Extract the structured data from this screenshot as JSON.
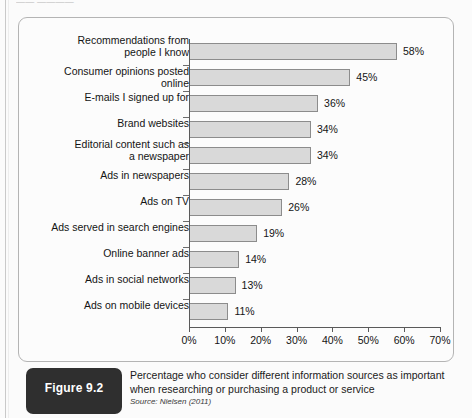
{
  "page": {
    "top_clipped_text": "—— ————"
  },
  "caption": {
    "figure_label": "Figure 9.2",
    "title": "Percentage who consider different information sources as important when researching or purchasing a product or service",
    "source": "Source: Nielsen (2011)"
  },
  "chart_data": {
    "type": "bar",
    "orientation": "horizontal",
    "title": "Percentage who consider different information sources as important when researching or purchasing a product or service",
    "xlabel": "",
    "ylabel": "",
    "xlim": [
      0,
      70
    ],
    "grid": false,
    "legend": null,
    "bar_color": "#d9d9d9",
    "bar_border_color": "#8c8c8c",
    "axis_color": "#5a5a5a",
    "xticks": [
      0,
      10,
      20,
      30,
      40,
      50,
      60,
      70
    ],
    "xticklabels": [
      "0%",
      "10%",
      "20%",
      "30%",
      "40%",
      "50%",
      "60%",
      "70%"
    ],
    "categories": [
      "Recommendations from\npeople I know",
      "Consumer opinions posted online",
      "E-mails I signed up for",
      "Brand websites",
      "Editorial content such as\na newspaper",
      "Ads in newspapers",
      "Ads on TV",
      "Ads served in search engines",
      "Online banner ads",
      "Ads in social networks",
      "Ads on mobile devices"
    ],
    "values": [
      58,
      45,
      36,
      34,
      34,
      28,
      26,
      19,
      14,
      13,
      11
    ],
    "value_labels": [
      "58%",
      "45%",
      "36%",
      "34%",
      "34%",
      "28%",
      "26%",
      "19%",
      "14%",
      "13%",
      "11%"
    ]
  }
}
